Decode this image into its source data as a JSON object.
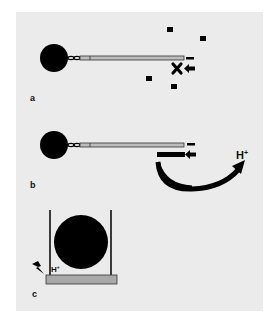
{
  "figure": {
    "background": "#ebebeb",
    "ink": "#000000",
    "rod_fill": "#bdbdbd",
    "plate_fill": "#a9a9a9",
    "panels": [
      {
        "id": "a",
        "label": "a",
        "elements": [
          "bead",
          "linker",
          "rod",
          "free-particles",
          "minus-sign",
          "blocked-x",
          "left-arrow"
        ]
      },
      {
        "id": "b",
        "label": "b",
        "elements": [
          "bead",
          "linker",
          "rod",
          "minus-sign",
          "bound-bar",
          "left-arrow",
          "curved-arrow",
          "proton-label"
        ],
        "proton_label": "H+",
        "proton_base": "H",
        "proton_sup": "+"
      },
      {
        "id": "c",
        "label": "c",
        "elements": [
          "well-posts",
          "large-bead",
          "base-plate",
          "lightning",
          "proton-label"
        ],
        "proton_base": "H",
        "proton_sup": "+"
      }
    ]
  }
}
